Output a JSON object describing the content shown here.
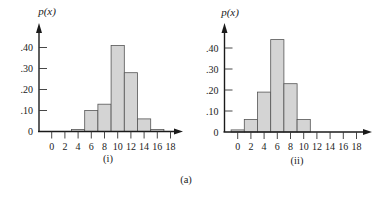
{
  "figure_label": "(a)",
  "chart_data": [
    {
      "type": "bar",
      "panel_label": "(i)",
      "title": "",
      "xlabel": "",
      "ylabel": "p(x)",
      "x_ticks": [
        "0",
        "2",
        "4",
        "6",
        "8",
        "10",
        "12",
        "14",
        "16",
        "18"
      ],
      "y_ticks": [
        "0",
        ".10",
        ".20",
        ".30",
        ".40"
      ],
      "ylim": [
        0,
        0.45
      ],
      "xlim": [
        0,
        18
      ],
      "grid": false,
      "categories": [
        4,
        6,
        8,
        10,
        12,
        14,
        16
      ],
      "values": [
        0.01,
        0.1,
        0.13,
        0.41,
        0.28,
        0.06,
        0.01
      ]
    },
    {
      "type": "bar",
      "panel_label": "(ii)",
      "title": "",
      "xlabel": "",
      "ylabel": "p(x)",
      "x_ticks": [
        "0",
        "2",
        "4",
        "6",
        "8",
        "10",
        "12",
        "14",
        "16",
        "18"
      ],
      "y_ticks": [
        "0",
        ".10",
        ".20",
        ".30",
        ".40"
      ],
      "ylim": [
        0,
        0.45
      ],
      "xlim": [
        0,
        18
      ],
      "grid": false,
      "categories": [
        0,
        2,
        4,
        6,
        8,
        10
      ],
      "values": [
        0.01,
        0.06,
        0.19,
        0.44,
        0.23,
        0.06
      ]
    }
  ]
}
